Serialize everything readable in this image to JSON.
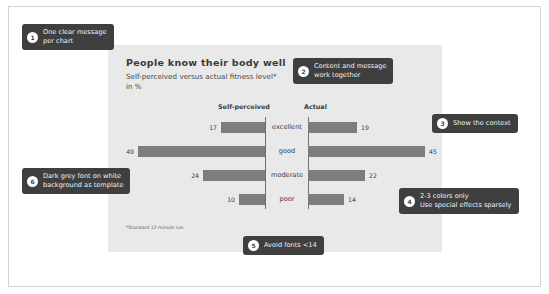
{
  "chart_data": {
    "type": "bar",
    "subtype": "butterfly-diverging",
    "title": "People know their body well",
    "subtitle": "Self-perceived versus actual fitness level*\nin %",
    "footnote": "*Standard 12-minute run",
    "categories": [
      "excellent",
      "good",
      "moderate",
      "poor"
    ],
    "series": [
      {
        "name": "Self-perceived",
        "side": "left",
        "values": [
          17,
          49,
          24,
          10
        ]
      },
      {
        "name": "Actual",
        "side": "right",
        "values": [
          19,
          45,
          22,
          14
        ]
      }
    ],
    "xlabel": "",
    "ylabel": "",
    "xlim": [
      0,
      49
    ],
    "grid": false,
    "legend": "column-headers",
    "bar_color": "#7d7d7d",
    "panel_color": "#e9e9e9",
    "text_color": "#3c3c3c"
  },
  "callouts": [
    {
      "num": "1",
      "text": "One clear message\nper chart"
    },
    {
      "num": "2",
      "text": "Content and message\nwork together"
    },
    {
      "num": "3",
      "text": "Show the context"
    },
    {
      "num": "4",
      "text": "2-3 colors only\nUse special effects sparsely"
    },
    {
      "num": "5",
      "text": "Avoid fonts <14"
    },
    {
      "num": "6",
      "text": "Dark grey font on white\nbackground as template"
    }
  ]
}
